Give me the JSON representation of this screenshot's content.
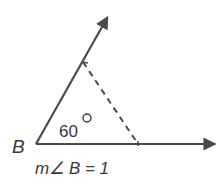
{
  "diagram": {
    "vertex_label": "B",
    "angle_label": "60",
    "degree_symbol": "°",
    "caption": "m∠ B = 1",
    "colors": {
      "stroke": "#4a4a4a",
      "text": "#3a3a3a",
      "background": "#ffffff"
    }
  }
}
